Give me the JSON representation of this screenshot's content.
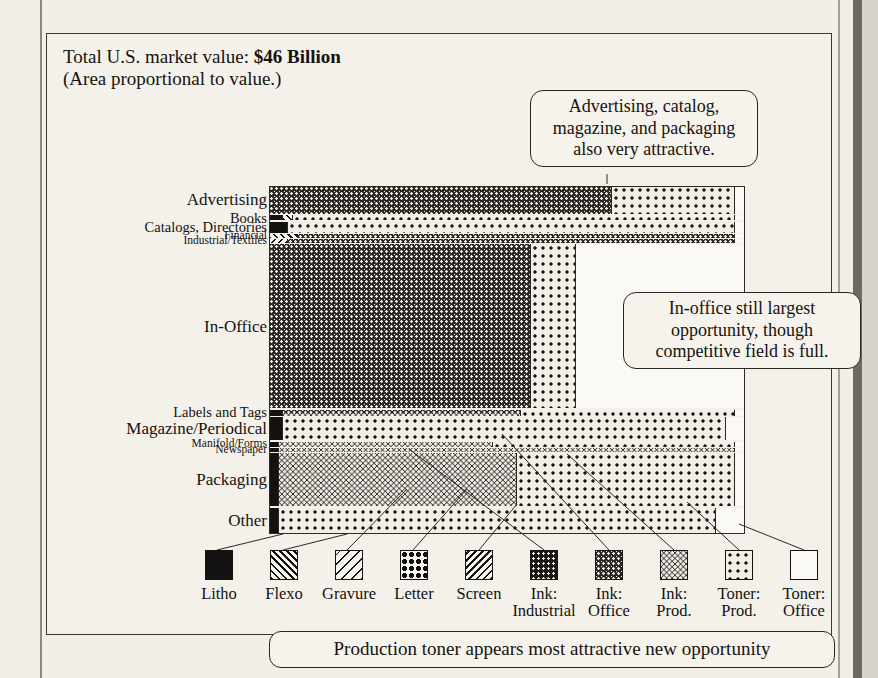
{
  "title": {
    "line1_prefix": "Total U.S. market value: ",
    "line1_value": "$46 Billion",
    "line2": "(Area proportional to value.)"
  },
  "callouts": {
    "top": "Advertising, catalog,\nmagazine, and packaging\nalso very attractive.",
    "middle": "In-office still largest\nopportunity, though\ncompetitive field is full.",
    "bottom": "Production toner appears most attractive new opportunity"
  },
  "legend": {
    "items": [
      {
        "key": "litho",
        "label": "Litho",
        "pattern": "solid-black"
      },
      {
        "key": "flexo",
        "label": "Flexo",
        "pattern": "diagonal-hatch-up"
      },
      {
        "key": "gravure",
        "label": "Gravure",
        "pattern": "sparse-diagonal"
      },
      {
        "key": "letter",
        "label": "Letter",
        "pattern": "large-dots"
      },
      {
        "key": "screen",
        "label": "Screen",
        "pattern": "diagonal-hatch-down"
      },
      {
        "key": "ink_ind",
        "label": "Ink:\nIndustrial",
        "pattern": "dark-fine-dots"
      },
      {
        "key": "ink_off",
        "label": "Ink:\nOffice",
        "pattern": "dark-dense-dots"
      },
      {
        "key": "ink_prod",
        "label": "Ink:\nProd.",
        "pattern": "dark-crosshatch"
      },
      {
        "key": "toner_prod",
        "label": "Toner:\nProd.",
        "pattern": "light-dots"
      },
      {
        "key": "toner_off",
        "label": "Toner:\nOffice",
        "pattern": "white"
      }
    ]
  },
  "chart_data": {
    "type": "mosaic",
    "title": "Total U.S. market value: $46 Billion",
    "subtitle": "(Area proportional to value.)",
    "xlabel": "",
    "ylabel": "",
    "note": "Marimekko / mosaic plot: row height is segment share of total market value; cell width is printing-process share within that segment.",
    "total_market_value_usd_billions": 46,
    "process_order": [
      "litho",
      "flexo",
      "gravure",
      "letter",
      "screen",
      "ink_ind",
      "ink_off",
      "ink_prod",
      "toner_prod",
      "toner_off"
    ],
    "process_labels": [
      "Litho",
      "Flexo",
      "Gravure",
      "Letter",
      "Screen",
      "Ink: Industrial",
      "Ink: Office",
      "Ink: Prod.",
      "Toner: Prod.",
      "Toner: Office"
    ],
    "segments": [
      {
        "name": "Advertising",
        "label_size": "large",
        "height_pct": 7.8,
        "shares": {
          "ink_off": 72.0,
          "toner_prod": 26.0,
          "toner_off": 2.0
        }
      },
      {
        "name": "Books",
        "label_size": "medium",
        "height_pct": 1.7,
        "shares": {
          "litho": 3.0,
          "flexo": 2.0,
          "toner_prod": 93.0,
          "toner_off": 2.0
        }
      },
      {
        "name": "Catalogs, Directories",
        "label_size": "medium",
        "height_pct": 3.2,
        "shares": {
          "litho": 4.0,
          "toner_prod": 94.0,
          "toner_off": 2.0
        }
      },
      {
        "name": "Financial",
        "label_size": "small",
        "height_pct": 1.4,
        "shares": {
          "flexo": 6.0,
          "ink_off": 92.0,
          "toner_off": 2.0
        }
      },
      {
        "name": "Industrial/Textiles",
        "label_size": "small",
        "height_pct": 1.4,
        "shares": {
          "screen": 4.0,
          "ink_off": 94.0,
          "toner_off": 2.0
        }
      },
      {
        "name": "In-Office",
        "label_size": "large",
        "height_pct": 44.0,
        "shares": {
          "ink_off": 55.0,
          "toner_prod": 9.5,
          "toner_off": 35.5
        }
      },
      {
        "name": "Labels and Tags",
        "label_size": "medium",
        "height_pct": 2.0,
        "shares": {
          "litho": 3.0,
          "ink_prod": 50.0,
          "toner_prod": 45.0,
          "toner_off": 2.0
        }
      },
      {
        "name": "Magazine/Periodical",
        "label_size": "large",
        "height_pct": 6.5,
        "shares": {
          "litho": 3.0,
          "toner_prod": 93.0,
          "toner_off": 4.0
        }
      },
      {
        "name": "Manifold/Forms",
        "label_size": "small",
        "height_pct": 1.7,
        "shares": {
          "litho": 2.0,
          "ink_prod": 45.0,
          "toner_prod": 51.0,
          "toner_off": 2.0
        }
      },
      {
        "name": "Newspaper",
        "label_size": "small",
        "height_pct": 1.4,
        "shares": {
          "litho": 2.0,
          "ink_prod": 96.0,
          "toner_off": 2.0
        }
      },
      {
        "name": "Packaging",
        "label_size": "large",
        "height_pct": 14.5,
        "shares": {
          "litho": 2.0,
          "ink_prod": 50.0,
          "toner_prod": 46.0,
          "toner_off": 2.0
        }
      },
      {
        "name": "Other",
        "label_size": "large",
        "height_pct": 7.0,
        "shares": {
          "litho": 2.0,
          "toner_prod": 92.0,
          "toner_off": 6.0
        }
      }
    ]
  }
}
